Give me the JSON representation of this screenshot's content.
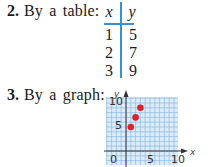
{
  "items": [
    {
      "number": "2.",
      "text": "By a table:"
    },
    {
      "number": "3.",
      "text": "By a graph:"
    }
  ],
  "table": {
    "headers": [
      "x",
      "y"
    ],
    "rows": [
      [
        "1",
        "5"
      ],
      [
        "2",
        "7"
      ],
      [
        "3",
        "9"
      ]
    ]
  },
  "chart_data": {
    "type": "scatter",
    "title": "",
    "xlabel": "x",
    "ylabel": "y",
    "x": [
      1,
      2,
      3
    ],
    "y": [
      5,
      7,
      9
    ],
    "xlim": [
      -3,
      11
    ],
    "ylim": [
      -3,
      11
    ],
    "xticks": [
      "0",
      "5",
      "10"
    ],
    "yticks": [
      "5",
      "10"
    ],
    "grid": true,
    "colors": {
      "points": "#d9232e",
      "grid": "#7fb5e0",
      "grid_bg": "#dcebf7",
      "axis": "#333333"
    }
  },
  "graph_labels": {
    "x_axis": "x",
    "y_axis": "y",
    "tick_0": "0",
    "tick_x5": "5",
    "tick_x10": "10",
    "tick_y5": "5",
    "tick_y10": "10"
  }
}
